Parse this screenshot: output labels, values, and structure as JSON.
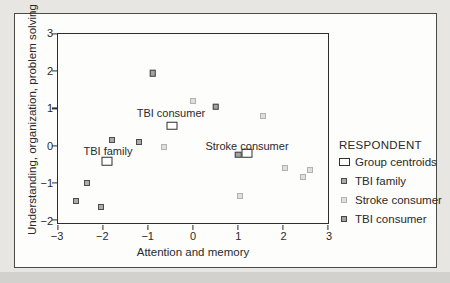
{
  "figure": {
    "page_background": "#e7e6e3",
    "figure_background": "#fdfdfc",
    "frame_border_color": "#4a4a48",
    "axis_color": "#2e2e2c",
    "text_color": "#2a2a2a"
  },
  "chart_data": {
    "type": "scatter",
    "title": "",
    "xlabel": "Attention and memory",
    "ylabel": "Understanding, organization, problem solving",
    "xlim": [
      -3,
      3
    ],
    "ylim": [
      -2,
      3
    ],
    "y_axis_top": 3,
    "y_axis_bottom": -2.08,
    "x_tick_values": [
      -3,
      -2,
      -1,
      0,
      1,
      2,
      3
    ],
    "y_tick_values": [
      3,
      2,
      1,
      0,
      -1,
      -2
    ],
    "grid": false,
    "legend_position": "right-outside",
    "legend_title": "RESPONDENT",
    "series": [
      {
        "name": "Group centroids",
        "marker": "centroid",
        "points": [
          {
            "x": -1.92,
            "y": -0.42
          },
          {
            "x": -0.46,
            "y": 0.54
          },
          {
            "x": 1.2,
            "y": -0.21
          }
        ]
      },
      {
        "name": "TBI family",
        "marker": "family",
        "points": [
          {
            "x": -1.8,
            "y": 0.15
          },
          {
            "x": -1.2,
            "y": 0.1
          },
          {
            "x": -2.35,
            "y": -1.0
          },
          {
            "x": -2.6,
            "y": -1.5
          },
          {
            "x": -2.05,
            "y": -1.65
          }
        ]
      },
      {
        "name": "Stroke consumer",
        "marker": "stroke",
        "points": [
          {
            "x": 0.0,
            "y": 1.2
          },
          {
            "x": 1.55,
            "y": 0.8
          },
          {
            "x": -0.65,
            "y": -0.05
          },
          {
            "x": 2.05,
            "y": -0.6
          },
          {
            "x": 2.6,
            "y": -0.65
          },
          {
            "x": 2.45,
            "y": -0.85
          },
          {
            "x": 1.05,
            "y": -1.35
          }
        ]
      },
      {
        "name": "TBI consumer",
        "marker": "consumer",
        "points": [
          {
            "x": -0.9,
            "y": 1.95
          },
          {
            "x": 0.5,
            "y": 1.05
          },
          {
            "x": 1.0,
            "y": -0.25
          }
        ]
      }
    ],
    "annotations": [
      {
        "text": "TBI family",
        "x": -1.89,
        "y": -0.15
      },
      {
        "text": "TBI consumer",
        "x": -0.49,
        "y": 0.89
      },
      {
        "text": "Stroke consumer",
        "x": 1.2,
        "y": 0.0
      }
    ],
    "legend_items": [
      {
        "label": "Group centroids",
        "marker": "centroid"
      },
      {
        "label": "TBI family",
        "marker": "family"
      },
      {
        "label": "Stroke consumer",
        "marker": "stroke"
      },
      {
        "label": "TBI consumer",
        "marker": "consumer"
      }
    ]
  }
}
